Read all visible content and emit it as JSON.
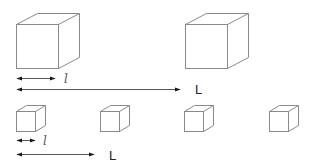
{
  "figure": {
    "colors": {
      "cube_edge": "#8a8a8a",
      "arrow": "#555555",
      "arrow_head": "#1a1a1a",
      "label": "#222222"
    },
    "top_row": {
      "cube_count": 2,
      "cube_side_label": "l",
      "spacing_label": "L"
    },
    "bottom_row": {
      "cube_count": 4,
      "cube_side_label": "l",
      "spacing_label": "L"
    }
  }
}
